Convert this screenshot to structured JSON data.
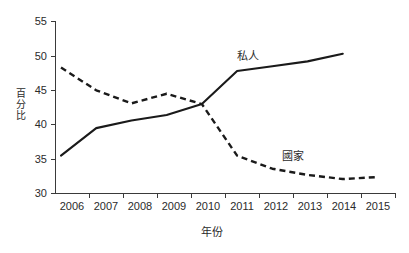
{
  "chart_data": {
    "type": "line",
    "title": "",
    "xlabel": "年份",
    "ylabel": "百分比",
    "x": [
      2006,
      2007,
      2008,
      2009,
      2010,
      2011,
      2012,
      2013,
      2014,
      2015
    ],
    "xticklabels": [
      "2006",
      "2007",
      "2008",
      "2009",
      "2010",
      "2011",
      "2012",
      "2013",
      "2014",
      "2015"
    ],
    "yticklabels": [
      "30",
      "35",
      "40",
      "45",
      "50",
      "55"
    ],
    "yticks": [
      30,
      35,
      40,
      45,
      50,
      55
    ],
    "ylim": [
      30,
      55
    ],
    "xlim": [
      2006,
      2015
    ],
    "grid": false,
    "legend": "inline-annotations",
    "series": [
      {
        "name": "私人",
        "style": "solid",
        "color": "#1a1a1a",
        "values": [
          35.5,
          39.5,
          40.6,
          41.4,
          43.0,
          47.8,
          48.5,
          49.2,
          50.3,
          null
        ]
      },
      {
        "name": "國家",
        "style": "dashed",
        "color": "#1a1a1a",
        "values": [
          48.3,
          45.0,
          43.1,
          44.5,
          43.0,
          35.5,
          33.6,
          32.7,
          32.1,
          32.4
        ]
      }
    ],
    "annotations": [
      {
        "text": "私人",
        "x": 2011.3,
        "y": 50.0
      },
      {
        "text": "國家",
        "x": 2012.6,
        "y": 35.5
      }
    ]
  }
}
